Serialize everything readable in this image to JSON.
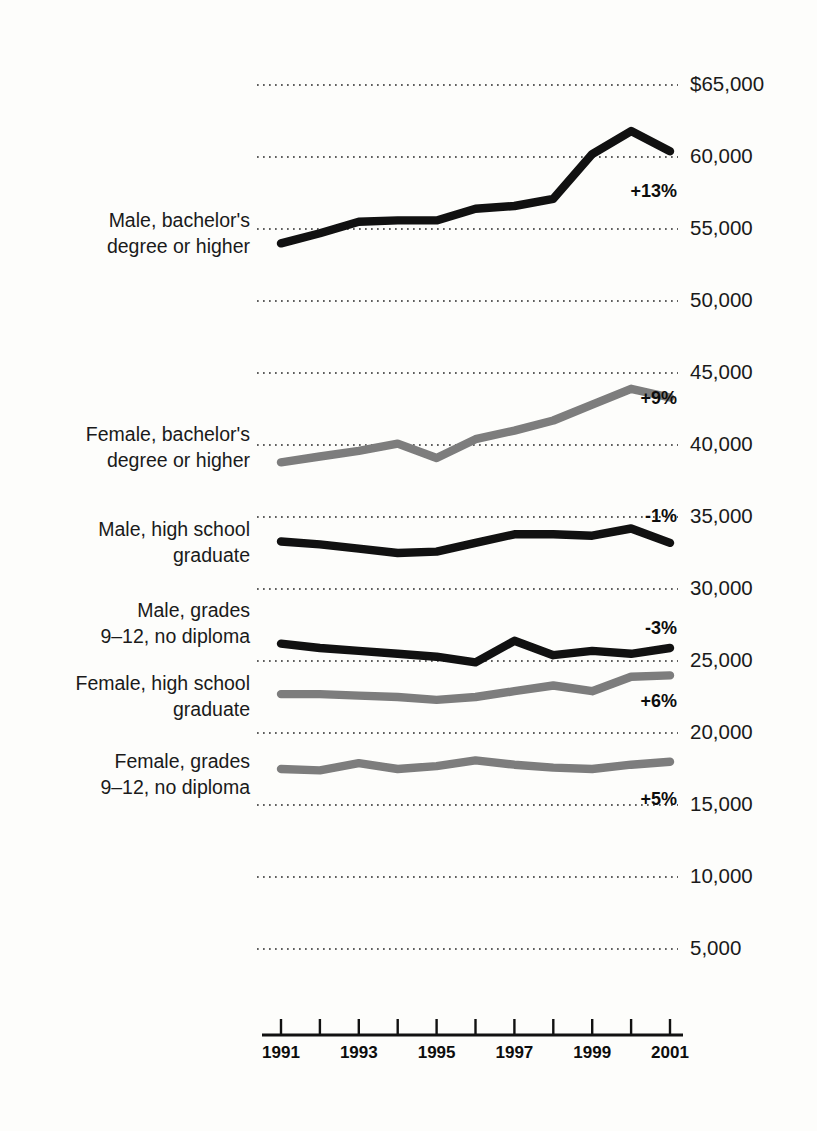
{
  "chart_data": {
    "type": "line",
    "title": "",
    "subtitle": "",
    "xlabel": "",
    "ylabel": "",
    "x": [
      1991,
      1992,
      1993,
      1994,
      1995,
      1996,
      1997,
      1998,
      1999,
      2000,
      2001
    ],
    "x_tick_labels": [
      "1991",
      "",
      "1993",
      "",
      "1995",
      "",
      "1997",
      "",
      "1999",
      "",
      "2001"
    ],
    "x_tick_labels_shown": [
      "1991",
      "1993",
      "1995",
      "1997",
      "1999",
      "2001"
    ],
    "xlim": [
      1991,
      2001
    ],
    "ylim": [
      0,
      65000
    ],
    "y_ticks": [
      5000,
      10000,
      15000,
      20000,
      25000,
      30000,
      35000,
      40000,
      45000,
      50000,
      55000,
      60000,
      65000
    ],
    "y_tick_labels": [
      "5,000",
      "10,000",
      "15,000",
      "20,000",
      "25,000",
      "30,000",
      "35,000",
      "40,000",
      "45,000",
      "50,000",
      "55,000",
      "60,000",
      "$65,000"
    ],
    "grid": true,
    "grid_style": "dotted-horizontal",
    "legend": "inline-left-labels",
    "series": [
      {
        "name": "Male, bachelor's degree or higher",
        "label_line1": "Male, bachelor's",
        "label_line2": "degree or higher",
        "color": "#111111",
        "change_label": "+13%",
        "values": [
          54000,
          54700,
          55500,
          55600,
          55600,
          56400,
          56600,
          57100,
          60200,
          61800,
          60400
        ]
      },
      {
        "name": "Female, bachelor's degree or higher",
        "label_line1": "Female, bachelor's",
        "label_line2": "degree or higher",
        "color": "#7d7d7d",
        "change_label": "+9%",
        "values": [
          38800,
          39200,
          39600,
          40100,
          39100,
          40400,
          41000,
          41700,
          42800,
          43900,
          43300
        ]
      },
      {
        "name": "Male, high school graduate",
        "label_line1": "Male, high school",
        "label_line2": "graduate",
        "color": "#111111",
        "change_label": "-1%",
        "values": [
          33300,
          33100,
          32800,
          32500,
          32600,
          33200,
          33800,
          33800,
          33700,
          34200,
          33200
        ]
      },
      {
        "name": "Male, grades 9–12, no diploma",
        "label_line1": "Male, grades",
        "label_line2": "9–12, no diploma",
        "color": "#111111",
        "change_label": "-3%",
        "values": [
          26200,
          25900,
          25700,
          25500,
          25300,
          24900,
          26400,
          25400,
          25700,
          25500,
          25900
        ]
      },
      {
        "name": "Female, high school graduate",
        "label_line1": "Female, high school",
        "label_line2": "graduate",
        "color": "#7d7d7d",
        "change_label": "+6%",
        "values": [
          22700,
          22700,
          22600,
          22500,
          22300,
          22500,
          22900,
          23300,
          22900,
          23900,
          24000
        ]
      },
      {
        "name": "Female, grades 9–12, no diploma",
        "label_line1": "Female, grades",
        "label_line2": "9–12, no diploma",
        "color": "#7d7d7d",
        "change_label": "+5%",
        "values": [
          17500,
          17400,
          17900,
          17500,
          17700,
          18100,
          17800,
          17600,
          17500,
          17800,
          18000
        ]
      }
    ]
  },
  "axis": {
    "y_tick_labels": [
      "$65,000",
      "60,000",
      "55,000",
      "50,000",
      "45,000",
      "40,000",
      "35,000",
      "30,000",
      "25,000",
      "20,000",
      "15,000",
      "10,000",
      "5,000"
    ],
    "x_tick_labels": [
      "1991",
      "1993",
      "1995",
      "1997",
      "1999",
      "2001"
    ]
  },
  "annotations": {
    "male_bachelors": "+13%",
    "female_bachelors": "+9%",
    "male_hs": "-1%",
    "male_9_12": "-3%",
    "female_hs": "+6%",
    "female_9_12": "+5%"
  },
  "colors": {
    "male": "#111111",
    "female": "#7d7d7d",
    "grid": "#2b2b2b",
    "background": "#fdfdfb"
  }
}
